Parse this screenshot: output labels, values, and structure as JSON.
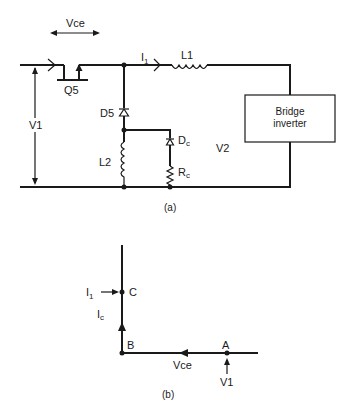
{
  "figure_a": {
    "caption": "(a)",
    "labels": {
      "vce": "Vce",
      "v1": "V1",
      "v2": "V2",
      "q5": "Q5",
      "i1": "I",
      "i1_sub": "1",
      "l1": "L1",
      "d5": "D5",
      "l2": "L2",
      "dc": "D",
      "dc_sub": "c",
      "rc": "R",
      "rc_sub": "c"
    },
    "bridge_inverter": {
      "line1": "Bridge",
      "line2": "inverter"
    }
  },
  "figure_b": {
    "caption": "(b)",
    "labels": {
      "c": "C",
      "b": "B",
      "a": "A",
      "i1": "I",
      "i1_sub": "1",
      "ic": "I",
      "ic_sub": "c",
      "vce": "Vce",
      "v1": "V1"
    }
  },
  "colors": {
    "ink": "#1a1a1a",
    "background": "#ffffff"
  }
}
